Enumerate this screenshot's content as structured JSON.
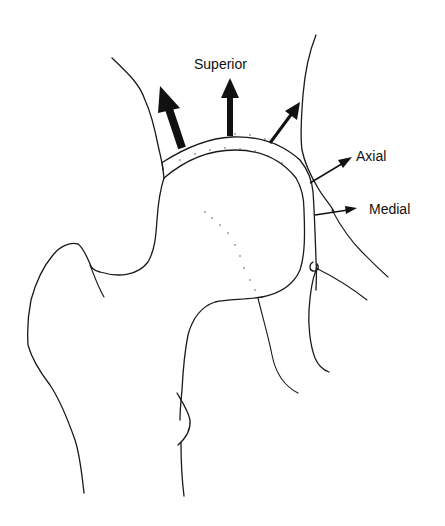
{
  "diagram": {
    "colors": {
      "ink": "#1a1a1a",
      "background": "#ffffff"
    },
    "labels": {
      "superior": "Superior",
      "axial": "Axial",
      "medial": "Medial"
    },
    "arrows": [
      {
        "name": "superolateral-force-arrow",
        "weight": "thick"
      },
      {
        "name": "superior-force-arrow",
        "weight": "medium",
        "label": "Superior"
      },
      {
        "name": "superomedial-force-arrow",
        "weight": "thin"
      },
      {
        "name": "axial-arrow",
        "weight": "hairline",
        "label": "Axial"
      },
      {
        "name": "medial-arrow",
        "weight": "hairline",
        "label": "Medial"
      }
    ]
  }
}
